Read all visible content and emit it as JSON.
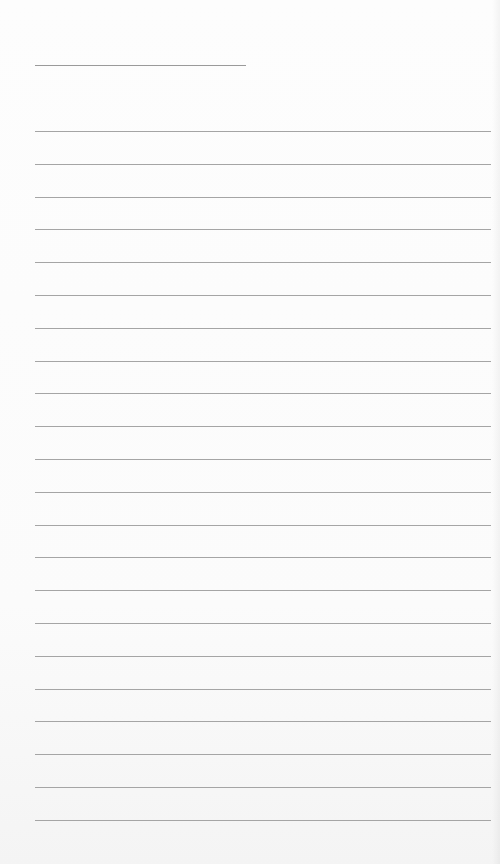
{
  "document": {
    "type": "lined-paper",
    "header_line": {
      "label": ""
    },
    "line_count": 22,
    "lines": [
      "",
      "",
      "",
      "",
      "",
      "",
      "",
      "",
      "",
      "",
      "",
      "",
      "",
      "",
      "",
      "",
      "",
      "",
      "",
      "",
      "",
      ""
    ],
    "colors": {
      "paper": "#fbfbfb",
      "rule": "#a5a5a5"
    }
  }
}
